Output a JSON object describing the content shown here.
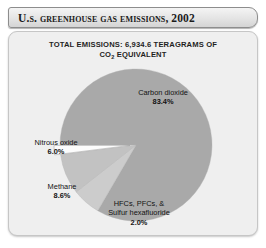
{
  "title": "U.S. Greenhouse Gas Emissions, 2002",
  "subtitle": {
    "line1": "TOTAL EMISSIONS: 6,934.6 TERAGRAMS OF",
    "line2_pre": "CO",
    "line2_sub": "2",
    "line2_post": " EQUIVALENT"
  },
  "labels": {
    "co2_name": "Carbon dioxide",
    "co2_pct": "83.4%",
    "n2o_name": "Nitrous oxide",
    "n2o_pct": "6.0%",
    "ch4_name": "Methane",
    "ch4_pct": "8.6%",
    "fgas_name_1": "HFCs, PFCs, &",
    "fgas_name_2": "Sulfur hexafluoride",
    "fgas_pct": "2.0%"
  },
  "colors": {
    "carbon_dioxide": "#a9a9a9",
    "methane": "#c2c2c2",
    "nitrous_oxide": "#cccccc",
    "fluorinated_gases": "#fcfcfc",
    "panel_background": "#efefef",
    "title_text": "#1b1b1b",
    "slice_edge": "#9a9a9a"
  },
  "chart_data": {
    "type": "pie",
    "title": "U.S. Greenhouse Gas Emissions, 2002",
    "subtitle": "TOTAL EMISSIONS: 6,934.6 TERAGRAMS OF CO2 EQUIVALENT",
    "total_emissions": 6934.6,
    "total_units": "Teragrams of CO2 equivalent",
    "year": 2002,
    "legend": "none",
    "labels_on_slices": true,
    "start_angle_deg": 180,
    "direction": "clockwise",
    "categories": [
      "Carbon dioxide",
      "Methane",
      "Nitrous oxide",
      "HFCs, PFCs, & Sulfur hexafluoride"
    ],
    "values": [
      83.4,
      8.6,
      6.0,
      2.0
    ],
    "value_units": "percent",
    "slices": [
      {
        "name": "Carbon dioxide",
        "value": 83.4,
        "label": "83.4%",
        "color": "#a9a9a9",
        "exploded": false
      },
      {
        "name": "Nitrous oxide",
        "value": 6.0,
        "label": "6.0%",
        "color": "#cccccc",
        "exploded": false
      },
      {
        "name": "Methane",
        "value": 8.6,
        "label": "8.6%",
        "color": "#c2c2c2",
        "exploded": false
      },
      {
        "name": "HFCs, PFCs, & Sulfur hexafluoride",
        "value": 2.0,
        "label": "2.0%",
        "color": "#fcfcfc",
        "exploded": true
      }
    ]
  }
}
